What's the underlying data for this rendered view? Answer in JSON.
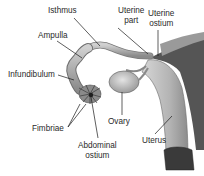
{
  "figure": {
    "labels": {
      "isthmus": "Isthmus",
      "ampulla": "Ampulla",
      "infundibulum": "Infundibulum",
      "fimbriae": "Fimbriae",
      "abdominal_ostium_line1": "Abdominal",
      "abdominal_ostium_line2": "ostium",
      "ovary": "Ovary",
      "uterus": "Uterus",
      "uterine_part_line1": "Uterine",
      "uterine_part_line2": "part",
      "uterine_ostium_line1": "Uterine",
      "uterine_ostium_line2": "ostium"
    }
  },
  "colors": {
    "tissue_light": "#c8c8c8",
    "tissue_mid": "#9a9a9a",
    "tissue_dark": "#4a4a4a",
    "leader_line": "#1a1a1a",
    "text": "#2a2a2a"
  }
}
